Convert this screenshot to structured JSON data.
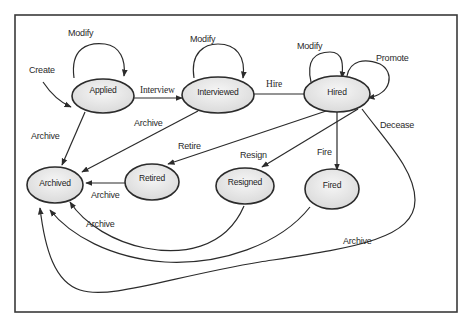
{
  "diagram": {
    "type": "state-machine",
    "title": "",
    "states": [
      {
        "id": "applied",
        "label": "Applied"
      },
      {
        "id": "interviewed",
        "label": "Interviewed"
      },
      {
        "id": "hired",
        "label": "Hired"
      },
      {
        "id": "archived",
        "label": "Archived"
      },
      {
        "id": "retired",
        "label": "Retired"
      },
      {
        "id": "resigned",
        "label": "Resigned"
      },
      {
        "id": "fired",
        "label": "Fired"
      }
    ],
    "transitions": [
      {
        "id": "create",
        "from": null,
        "to": "applied",
        "label": "Create"
      },
      {
        "id": "modify_applied",
        "from": "applied",
        "to": "applied",
        "label": "Modify"
      },
      {
        "id": "interview",
        "from": "applied",
        "to": "interviewed",
        "label": "Interview"
      },
      {
        "id": "modify_interviewed",
        "from": "interviewed",
        "to": "interviewed",
        "label": "Modify"
      },
      {
        "id": "hire",
        "from": "interviewed",
        "to": "hired",
        "label": "Hire"
      },
      {
        "id": "modify_hired",
        "from": "hired",
        "to": "hired",
        "label": "Modify"
      },
      {
        "id": "promote",
        "from": "hired",
        "to": "hired",
        "label": "Promote"
      },
      {
        "id": "archive_applied",
        "from": "applied",
        "to": "archived",
        "label": "Archive"
      },
      {
        "id": "archive_interviewed",
        "from": "interviewed",
        "to": "archived",
        "label": "Archive"
      },
      {
        "id": "retire",
        "from": "hired",
        "to": "retired",
        "label": "Retire"
      },
      {
        "id": "resign",
        "from": "hired",
        "to": "resigned",
        "label": "Resign"
      },
      {
        "id": "fire",
        "from": "hired",
        "to": "fired",
        "label": "Fire"
      },
      {
        "id": "decease",
        "from": "hired",
        "to": "archived",
        "label": "Decease"
      },
      {
        "id": "archive_retired",
        "from": "retired",
        "to": "archived",
        "label": "Archive"
      },
      {
        "id": "archive_resigned",
        "from": "resigned",
        "to": "archived",
        "label": "Archive"
      },
      {
        "id": "archive_fired",
        "from": "fired",
        "to": "archived",
        "label": "Archive"
      },
      {
        "id": "archive_decease",
        "from": "hired",
        "to": "archived",
        "label": "Archive"
      }
    ]
  },
  "labels": {
    "applied": "Applied",
    "interviewed": "Interviewed",
    "hired": "Hired",
    "archived": "Archived",
    "retired": "Retired",
    "resigned": "Resigned",
    "fired": "Fired",
    "create": "Create",
    "modify_applied": "Modify",
    "modify_interviewed": "Modify",
    "modify_hired": "Modify",
    "promote": "Promote",
    "interview": "Interview",
    "hire": "Hire",
    "archive_applied": "Archive",
    "archive_interviewed": "Archive",
    "retire": "Retire",
    "resign": "Resign",
    "fire": "Fire",
    "decease": "Decease",
    "archive_retired": "Archive",
    "archive_resigned": "Archive",
    "archive_far": "Archive"
  },
  "colors": {
    "stroke": "#2b2b2b",
    "node_fill_top": "#f4f4f4",
    "node_fill_bottom": "#dcdcdc",
    "frame": "#3a3a3a",
    "background": "#ffffff"
  }
}
